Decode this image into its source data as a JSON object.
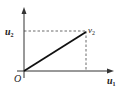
{
  "diagram": {
    "type": "coordinate-projection",
    "origin_label": "O",
    "x_axis": {
      "label": "u",
      "label_subscript": "1"
    },
    "y_axis": {
      "label": "u",
      "label_subscript": "2",
      "label_prime": "'"
    },
    "point": {
      "label": "v",
      "label_subscript": "2"
    },
    "elements": [
      "x-axis with arrow",
      "y-axis with arrow",
      "solid segment from O to v2",
      "dashed projection to x-axis",
      "dashed projection to y-axis"
    ]
  }
}
